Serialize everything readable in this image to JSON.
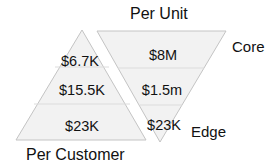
{
  "title_top": "Per Unit",
  "title_bottom": "Per Customer",
  "label_core": "Core",
  "label_edge": "Edge",
  "colors": {
    "fill": "#f2f2f2",
    "stroke": "#bfbfbf",
    "divider": "#dcdcdc",
    "text": "#111111"
  },
  "per_customer": {
    "shape": "upright-triangle",
    "tiers": [
      {
        "value": "$6.7K"
      },
      {
        "value": "$15.5K"
      },
      {
        "value": "$23K"
      }
    ]
  },
  "per_unit": {
    "shape": "inverted-triangle",
    "tiers": [
      {
        "value": "$8M"
      },
      {
        "value": "$1.5m"
      },
      {
        "value": "$23K"
      }
    ]
  }
}
